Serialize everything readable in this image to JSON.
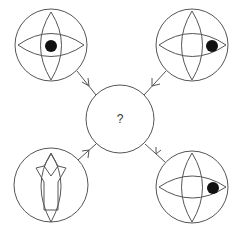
{
  "diagram": {
    "center": {
      "label": "?",
      "cx": 120,
      "cy": 119,
      "r": 34
    },
    "stroke_color": "#555555",
    "dot_color": "#111111",
    "panels": [
      {
        "id": "top-left",
        "cx": 51,
        "cy": 45,
        "r": 36,
        "shape": "eye-with-crossing-lens",
        "pupil_position": "center",
        "arrow_to_center": true
      },
      {
        "id": "top-right",
        "cx": 192,
        "cy": 45,
        "r": 36,
        "shape": "eye-with-crossing-lens",
        "pupil_position": "right",
        "arrow_to_center": true
      },
      {
        "id": "bottom-left",
        "cx": 51,
        "cy": 185,
        "r": 37,
        "shape": "y-shape-in-lens",
        "arrow_to_center": true
      },
      {
        "id": "bottom-right",
        "cx": 192,
        "cy": 187,
        "r": 36,
        "shape": "eye-with-crossing-lens",
        "pupil_position": "right",
        "arrow_to_center": true
      }
    ]
  }
}
